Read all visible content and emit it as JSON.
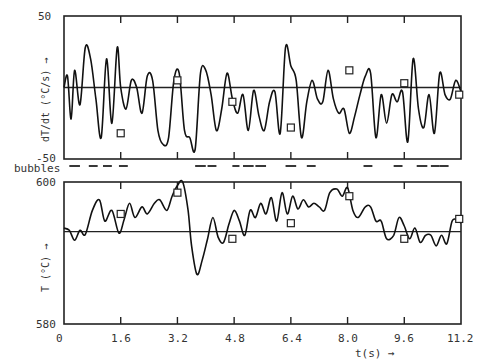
{
  "chart_data": [
    {
      "type": "line",
      "title": "",
      "ylabel": "dT/dt (°C/s) →",
      "xlabel": "",
      "ylim": [
        -50,
        50
      ],
      "xlim": [
        0,
        11.2
      ],
      "y_ticks": [
        "50",
        "-50"
      ],
      "zero_line": 0,
      "x": [
        0,
        0.1,
        0.2,
        0.3,
        0.45,
        0.6,
        0.75,
        0.9,
        1.05,
        1.2,
        1.35,
        1.5,
        1.6,
        1.75,
        1.9,
        2.05,
        2.2,
        2.35,
        2.5,
        2.65,
        2.8,
        2.95,
        3.1,
        3.25,
        3.4,
        3.55,
        3.7,
        3.85,
        4.0,
        4.15,
        4.3,
        4.45,
        4.6,
        4.75,
        4.9,
        5.05,
        5.2,
        5.35,
        5.5,
        5.65,
        5.8,
        5.95,
        6.1,
        6.25,
        6.4,
        6.55,
        6.7,
        6.85,
        7.0,
        7.15,
        7.3,
        7.45,
        7.6,
        7.75,
        7.9,
        8.05,
        8.2,
        8.35,
        8.5,
        8.65,
        8.8,
        8.95,
        9.1,
        9.25,
        9.4,
        9.55,
        9.7,
        9.85,
        10.0,
        10.15,
        10.3,
        10.45,
        10.6,
        10.75,
        10.9,
        11.05,
        11.2
      ],
      "values": [
        0,
        8,
        -22,
        12,
        -12,
        28,
        20,
        -8,
        -35,
        20,
        -25,
        28,
        0,
        -15,
        5,
        0,
        -18,
        8,
        5,
        -30,
        -40,
        -35,
        5,
        10,
        -30,
        -35,
        -43,
        10,
        12,
        -5,
        -30,
        -15,
        10,
        -8,
        -18,
        -5,
        -30,
        -2,
        -20,
        -30,
        -10,
        -3,
        -32,
        28,
        15,
        5,
        -35,
        -10,
        5,
        -8,
        -10,
        12,
        -8,
        -18,
        -15,
        -32,
        -20,
        -5,
        8,
        10,
        -35,
        -5,
        -25,
        -5,
        -10,
        -3,
        -38,
        20,
        -15,
        -28,
        -5,
        -32,
        10,
        -5,
        -8,
        5,
        -3
      ],
      "markers": {
        "x": [
          1.6,
          3.2,
          4.75,
          6.4,
          8.05,
          9.6,
          11.15
        ],
        "y": [
          -32,
          5,
          -10,
          -28,
          12,
          3,
          -5
        ],
        "shape": "square"
      }
    },
    {
      "type": "line",
      "title": "",
      "ylabel": "T (°C) →",
      "xlabel": "t(s) →",
      "ylim": [
        580,
        600
      ],
      "xlim": [
        0,
        11.2
      ],
      "y_ticks": [
        "600",
        "580"
      ],
      "x_ticks": [
        "0",
        "1.6",
        "3.2",
        "4.8",
        "6.4",
        "8.0",
        "9.6",
        "11.2"
      ],
      "zero_line": 593,
      "x": [
        0,
        0.15,
        0.3,
        0.45,
        0.6,
        0.8,
        1.0,
        1.15,
        1.35,
        1.55,
        1.7,
        1.85,
        2.0,
        2.2,
        2.35,
        2.55,
        2.7,
        2.9,
        3.05,
        3.2,
        3.35,
        3.5,
        3.6,
        3.75,
        3.9,
        4.05,
        4.2,
        4.35,
        4.5,
        4.65,
        4.8,
        4.95,
        5.1,
        5.25,
        5.4,
        5.55,
        5.7,
        5.85,
        6.0,
        6.15,
        6.3,
        6.45,
        6.6,
        6.75,
        6.9,
        7.05,
        7.2,
        7.35,
        7.5,
        7.7,
        7.85,
        8.0,
        8.15,
        8.3,
        8.5,
        8.65,
        8.8,
        8.95,
        9.1,
        9.3,
        9.45,
        9.6,
        9.75,
        9.9,
        10.05,
        10.2,
        10.35,
        10.5,
        10.65,
        10.8,
        10.95,
        11.1,
        11.2
      ],
      "values": [
        593.5,
        593.2,
        591.8,
        593.2,
        592.6,
        596,
        597.5,
        594.5,
        596,
        592.8,
        594.8,
        597,
        595,
        596.5,
        595.5,
        597,
        597.5,
        596,
        598,
        599.5,
        600,
        596,
        591,
        587,
        589,
        592,
        595,
        592.2,
        591.5,
        594,
        596,
        594.5,
        592.5,
        596,
        595,
        597,
        595.5,
        597.8,
        594.5,
        598.5,
        595.5,
        598,
        596.2,
        597.5,
        596.5,
        597,
        596.5,
        596,
        598.5,
        599,
        598,
        599.2,
        596,
        595,
        596.5,
        596.5,
        594.5,
        594.5,
        592,
        592.5,
        595,
        593.8,
        592,
        593.5,
        591.5,
        592.5,
        592.5,
        591,
        592.5,
        591.3,
        594.5,
        594.6,
        594.2
      ],
      "markers": {
        "x": [
          1.6,
          3.2,
          4.75,
          6.4,
          8.05,
          9.6,
          11.15
        ],
        "y": [
          595.5,
          598.5,
          592,
          594.2,
          598,
          592,
          594.8
        ],
        "shape": "square"
      }
    },
    {
      "type": "bar",
      "title": "bubbles",
      "description": "event dashes between the two panels",
      "segments": [
        [
          0.15,
          0.45
        ],
        [
          0.7,
          0.95
        ],
        [
          1.1,
          1.35
        ],
        [
          1.55,
          1.8
        ],
        [
          3.7,
          4.0
        ],
        [
          4.05,
          4.3
        ],
        [
          4.75,
          4.95
        ],
        [
          5.05,
          5.35
        ],
        [
          5.4,
          5.7
        ],
        [
          6.25,
          6.55
        ],
        [
          6.85,
          7.1
        ],
        [
          8.45,
          8.7
        ],
        [
          9.3,
          9.55
        ],
        [
          9.95,
          10.25
        ],
        [
          10.35,
          10.6
        ],
        [
          10.6,
          10.85
        ]
      ]
    }
  ],
  "labels": {
    "top_ymax": "50",
    "top_ymin": "-50",
    "top_ylabel": "dT/dt (°C/s) →",
    "bubbles": "bubbles",
    "bottom_ymax": "600",
    "bottom_ymin": "580",
    "bottom_ylabel": "T (°C) →",
    "xlabel": "t(s) →",
    "xticks": [
      "0",
      "1.6",
      "3.2",
      "4.8",
      "6.4",
      "8.0",
      "9.6",
      "11.2"
    ]
  }
}
